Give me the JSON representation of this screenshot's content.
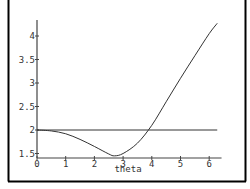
{
  "chart_data": {
    "type": "line",
    "title": "",
    "xlabel": "theta",
    "ylabel": "",
    "xlim": [
      0,
      6.43
    ],
    "ylim": [
      1.4,
      4.35
    ],
    "grid": false,
    "legend": null,
    "x_ticks": [
      "0",
      "1",
      "2",
      "3",
      "4",
      "5",
      "6"
    ],
    "y_ticks": [
      "1.5",
      "2",
      "2.5",
      "3",
      "3.5",
      "4"
    ],
    "series": [
      {
        "name": "curve",
        "x": [
          0,
          0.5,
          1,
          1.5,
          2,
          2.5,
          2.7,
          3,
          3.5,
          4,
          4.5,
          5,
          5.5,
          6,
          6.28
        ],
        "y": [
          2.0,
          1.98,
          1.92,
          1.8,
          1.65,
          1.49,
          1.45,
          1.5,
          1.72,
          2.1,
          2.6,
          3.1,
          3.58,
          4.05,
          4.27
        ]
      },
      {
        "name": "constant",
        "x": [
          0,
          6.28
        ],
        "y": [
          2.0,
          2.0
        ]
      }
    ]
  }
}
